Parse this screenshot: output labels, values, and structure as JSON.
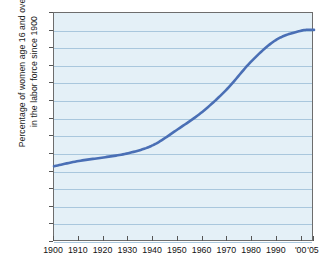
{
  "chart_data": {
    "type": "line",
    "title": "",
    "xlabel": "",
    "ylabel_line1": "Percentage of women age 16 and over",
    "ylabel_line2": "in the labor force since 1900",
    "ylim": [
      0,
      65
    ],
    "yticks": [
      0,
      5,
      10,
      15,
      20,
      25,
      30,
      35,
      40,
      45,
      50,
      55,
      60,
      65
    ],
    "xlim": [
      1900,
      2005
    ],
    "xtick_labels": [
      "1900",
      "1910",
      "1920",
      "1930",
      "1940",
      "1950",
      "1960",
      "1970",
      "1980",
      "1990",
      "'00",
      "'05"
    ],
    "xtick_values": [
      1900,
      1910,
      1920,
      1930,
      1940,
      1950,
      1960,
      1970,
      1980,
      1990,
      2000,
      2005
    ],
    "grid": true,
    "legend": "none",
    "series": [
      {
        "name": "Percentage of women age 16 and over in the labor force",
        "color": "#4a6fb5",
        "x": [
          1900,
          1910,
          1920,
          1930,
          1940,
          1950,
          1960,
          1970,
          1980,
          1990,
          2000,
          2005
        ],
        "values": [
          21.5,
          23.0,
          24.0,
          25.2,
          27.5,
          32.0,
          37.0,
          43.5,
          51.5,
          57.5,
          60.0,
          60.2
        ]
      }
    ],
    "colors": {
      "line": "#4a6fb5",
      "plot_background": "#e4f0f7",
      "gridline": "#a9c7dd",
      "axis_border": "#6d6d6d",
      "text": "#111111",
      "page_background": "#ffffff"
    }
  }
}
